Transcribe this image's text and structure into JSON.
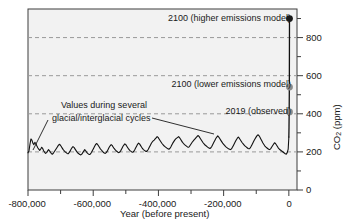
{
  "chart_data": {
    "type": "line",
    "title": "",
    "xlabel": "Year (before present)",
    "ylabel": "CO2 (ppm)",
    "ylabel_rich": "CO₂ (ppm)",
    "xlim": [
      -800000,
      25000
    ],
    "ylim": [
      0,
      950
    ],
    "grid": "horizontal dashed at 200, 400, 600, 800",
    "legend": "none",
    "x_ticks": [
      -800000,
      -600000,
      -400000,
      -200000,
      0
    ],
    "x_tick_labels": [
      "-800,000",
      "-600,000",
      "-400,000",
      "-200,000",
      "0"
    ],
    "x_minor_ticks": [
      -700000,
      -500000,
      -300000,
      -100000
    ],
    "y_ticks": [
      0,
      200,
      400,
      600,
      800
    ],
    "y_tick_labels": [
      "0",
      "200",
      "400",
      "600",
      "800"
    ],
    "y_minor_ticks": [
      100,
      300,
      500,
      700,
      900
    ],
    "series": [
      {
        "name": "Ice core CO2 record",
        "color": "#111111",
        "x": [
          -800000,
          -797000,
          -794000,
          -791000,
          -788000,
          -785000,
          -782000,
          -779000,
          -776000,
          -773000,
          -770000,
          -767000,
          -764000,
          -761000,
          -758000,
          -755000,
          -752000,
          -749000,
          -746000,
          -743000,
          -740000,
          -737000,
          -734000,
          -731000,
          -728000,
          -725000,
          -722000,
          -719000,
          -716000,
          -713000,
          -710000,
          -707000,
          -704000,
          -701000,
          -698000,
          -695000,
          -692000,
          -689000,
          -686000,
          -683000,
          -680000,
          -677000,
          -674000,
          -671000,
          -668000,
          -665000,
          -662000,
          -659000,
          -656000,
          -653000,
          -650000,
          -647000,
          -644000,
          -641000,
          -638000,
          -635000,
          -632000,
          -629000,
          -626000,
          -623000,
          -620000,
          -617000,
          -614000,
          -611000,
          -608000,
          -605000,
          -602000,
          -599000,
          -596000,
          -593000,
          -590000,
          -587000,
          -584000,
          -581000,
          -578000,
          -575000,
          -572000,
          -569000,
          -566000,
          -563000,
          -560000,
          -557000,
          -554000,
          -551000,
          -548000,
          -545000,
          -542000,
          -539000,
          -536000,
          -533000,
          -530000,
          -527000,
          -524000,
          -521000,
          -518000,
          -515000,
          -512000,
          -509000,
          -506000,
          -503000,
          -500000,
          -497000,
          -494000,
          -491000,
          -488000,
          -485000,
          -482000,
          -479000,
          -476000,
          -473000,
          -470000,
          -467000,
          -464000,
          -461000,
          -458000,
          -455000,
          -452000,
          -449000,
          -446000,
          -443000,
          -440000,
          -437000,
          -434000,
          -431000,
          -428000,
          -425000,
          -422000,
          -419000,
          -416000,
          -413000,
          -410000,
          -407000,
          -404000,
          -401000,
          -398000,
          -395000,
          -392000,
          -389000,
          -386000,
          -383000,
          -380000,
          -377000,
          -374000,
          -371000,
          -368000,
          -365000,
          -362000,
          -359000,
          -356000,
          -353000,
          -350000,
          -347000,
          -344000,
          -341000,
          -338000,
          -335000,
          -332000,
          -329000,
          -326000,
          -323000,
          -320000,
          -317000,
          -314000,
          -311000,
          -308000,
          -305000,
          -302000,
          -299000,
          -296000,
          -293000,
          -290000,
          -287000,
          -284000,
          -281000,
          -278000,
          -275000,
          -272000,
          -269000,
          -266000,
          -263000,
          -260000,
          -257000,
          -254000,
          -251000,
          -248000,
          -245000,
          -242000,
          -239000,
          -236000,
          -233000,
          -230000,
          -227000,
          -224000,
          -221000,
          -218000,
          -215000,
          -212000,
          -209000,
          -206000,
          -203000,
          -200000,
          -197000,
          -194000,
          -191000,
          -188000,
          -185000,
          -182000,
          -179000,
          -176000,
          -173000,
          -170000,
          -167000,
          -164000,
          -161000,
          -158000,
          -155000,
          -152000,
          -149000,
          -146000,
          -143000,
          -140000,
          -137000,
          -134000,
          -131000,
          -128000,
          -125000,
          -122000,
          -119000,
          -116000,
          -113000,
          -110000,
          -107000,
          -104000,
          -101000,
          -98000,
          -95000,
          -92000,
          -89000,
          -86000,
          -83000,
          -80000,
          -77000,
          -74000,
          -71000,
          -68000,
          -65000,
          -62000,
          -59000,
          -56000,
          -53000,
          -50000,
          -47000,
          -44000,
          -41000,
          -38000,
          -35000,
          -32000,
          -29000,
          -26000,
          -23000,
          -20000,
          -17000,
          -14000,
          -11000,
          -8000,
          -5000,
          -2000,
          0
        ],
        "y": [
          195,
          205,
          240,
          268,
          262,
          246,
          238,
          250,
          244,
          232,
          222,
          214,
          208,
          215,
          224,
          218,
          206,
          198,
          192,
          196,
          204,
          212,
          206,
          198,
          190,
          188,
          194,
          202,
          210,
          218,
          226,
          234,
          240,
          236,
          228,
          220,
          212,
          206,
          200,
          196,
          192,
          190,
          196,
          204,
          214,
          222,
          228,
          224,
          216,
          208,
          200,
          194,
          190,
          186,
          184,
          188,
          196,
          204,
          212,
          206,
          198,
          192,
          188,
          186,
          190,
          198,
          208,
          218,
          228,
          238,
          244,
          240,
          232,
          224,
          216,
          210,
          204,
          198,
          194,
          192,
          196,
          204,
          214,
          224,
          232,
          238,
          234,
          226,
          218,
          212,
          206,
          202,
          198,
          196,
          200,
          208,
          218,
          228,
          236,
          242,
          238,
          230,
          222,
          214,
          208,
          204,
          200,
          198,
          202,
          210,
          220,
          230,
          240,
          246,
          242,
          234,
          226,
          218,
          212,
          208,
          204,
          202,
          206,
          214,
          224,
          234,
          244,
          252,
          258,
          262,
          268,
          274,
          280,
          276,
          268,
          260,
          252,
          244,
          238,
          232,
          228,
          224,
          220,
          216,
          214,
          218,
          226,
          236,
          246,
          254,
          262,
          268,
          272,
          276,
          280,
          274,
          266,
          258,
          250,
          244,
          238,
          234,
          230,
          226,
          224,
          228,
          236,
          244,
          252,
          258,
          264,
          270,
          276,
          282,
          286,
          280,
          272,
          264,
          256,
          248,
          242,
          236,
          232,
          228,
          224,
          220,
          218,
          222,
          230,
          240,
          250,
          260,
          270,
          278,
          284,
          278,
          270,
          262,
          254,
          246,
          240,
          234,
          228,
          224,
          220,
          216,
          214,
          212,
          216,
          224,
          234,
          244,
          254,
          264,
          272,
          278,
          272,
          264,
          256,
          248,
          242,
          236,
          230,
          226,
          222,
          218,
          216,
          220,
          228,
          238,
          248,
          258,
          268,
          276,
          284,
          290,
          286,
          278,
          268,
          258,
          248,
          240,
          232,
          226,
          222,
          218,
          214,
          212,
          216,
          224,
          232,
          240,
          248,
          244,
          236,
          228,
          220,
          214,
          210,
          206,
          202,
          198,
          194,
          190,
          188,
          196,
          215,
          278
        ]
      },
      {
        "name": "Recent rise and projections",
        "color": "#111111",
        "x": [
          0,
          500,
          1000,
          1500,
          2000
        ],
        "y": [
          278,
          330,
          410,
          540,
          900
        ]
      }
    ],
    "markers": [
      {
        "name": "2100 (higher emissions model)",
        "label": "2100 (higher emissions model)",
        "value": 900,
        "color": "#1a1a1a"
      },
      {
        "name": "2100 (lower emissions model)",
        "label": "2100 (lower emissions model)",
        "value": 540,
        "color": "#8a8a8a"
      },
      {
        "name": "2019 (observed)",
        "label": "2019 (observed)",
        "value": 410,
        "color": "#8a8a8a"
      }
    ],
    "annotations": [
      {
        "name": "glacial-cycles-note",
        "line1": "Values during several",
        "line2": "glacial/interglacial cycles"
      }
    ],
    "colors": {
      "plot_background": "#f2f2f2",
      "axis": "#3d3d3d",
      "gridline": "#9a9a9a",
      "line": "#111111",
      "marker_dark": "#1a1a1a",
      "marker_gray": "#8a8a8a",
      "text": "#1a1a1a"
    }
  }
}
